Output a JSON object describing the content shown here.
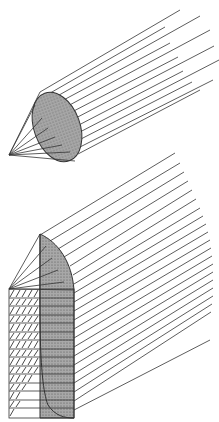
{
  "figure": {
    "colors": {
      "line": "#333333",
      "fill": "#9a9a9a",
      "background": "#ffffff"
    },
    "top_figure": {
      "apex": [
        10,
        155
      ],
      "ellipse": {
        "cx": 58,
        "cy": 127,
        "rx": 23,
        "ry": 36,
        "rotate": -20
      },
      "ray_count": 12
    },
    "bottom_figure": {
      "ray_count": 24,
      "hatched_rows": 15
    }
  }
}
